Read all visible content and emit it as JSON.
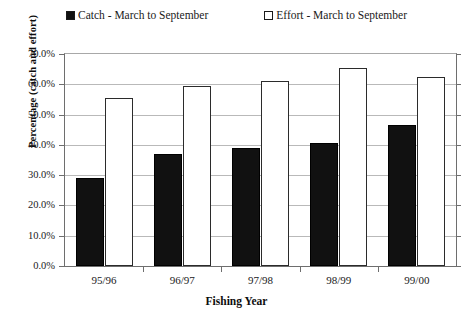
{
  "chart_data": {
    "type": "bar",
    "title": "",
    "xlabel": "Fishing Year",
    "ylabel": "Percentage (catch and effort)",
    "categories": [
      "95/96",
      "96/97",
      "97/98",
      "98/99",
      "99/00"
    ],
    "series": [
      {
        "name": "Catch - March to September",
        "values": [
          29.0,
          37.0,
          39.0,
          40.6,
          46.4
        ],
        "color": "#111111",
        "style": "filled"
      },
      {
        "name": "Effort - March to September",
        "values": [
          55.6,
          59.3,
          61.0,
          65.5,
          62.4
        ],
        "color": "#ffffff",
        "style": "hollow"
      }
    ],
    "ylim": [
      0,
      70
    ],
    "ytick_values": [
      70,
      60,
      50,
      40,
      30,
      20,
      10,
      0
    ],
    "ytick_labels": [
      "70.0%",
      "60.0%",
      "50.0%",
      "40.0%",
      "30.0%",
      "20.0%",
      "10.0%",
      "0.0%"
    ],
    "grid": true,
    "legend_position": "top"
  },
  "legend": {
    "entries": [
      {
        "label": "Catch - March to September",
        "swatch": "filled-square"
      },
      {
        "label": "Effort - March to September",
        "swatch": "hollow-square"
      }
    ]
  },
  "axes": {
    "y_title": "Percentage (catch and effort)",
    "x_title": "Fishing Year"
  }
}
